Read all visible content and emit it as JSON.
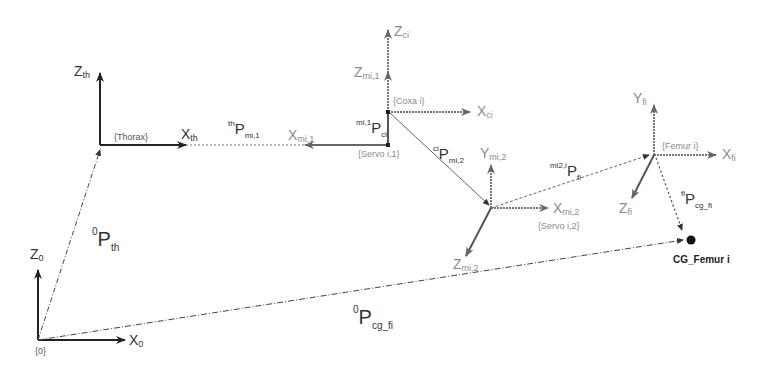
{
  "diagram": {
    "type": "kinematic-frame-diagram",
    "frames": [
      {
        "id": "world",
        "label": "{0}",
        "axes": {
          "z": {
            "base": "Z",
            "sub": "0"
          },
          "x": {
            "base": "X",
            "sub": "0"
          }
        }
      },
      {
        "id": "thorax",
        "label": "{Thorax}",
        "axes": {
          "z": {
            "base": "Z",
            "sub": "th"
          },
          "x": {
            "base": "X",
            "sub": "th"
          }
        }
      },
      {
        "id": "servo1",
        "label": "{Servo i,1}",
        "axes": {
          "z": {
            "base": "Z",
            "sub": "mi,1"
          },
          "x": {
            "base": "X",
            "sub": "mi,1"
          }
        }
      },
      {
        "id": "coxa",
        "label": "{Coxa i}",
        "axes": {
          "z": {
            "base": "Z",
            "sub": "ci"
          },
          "x": {
            "base": "X",
            "sub": "ci"
          }
        }
      },
      {
        "id": "servo2",
        "label": "{Servo i,2}",
        "axes": {
          "y": {
            "base": "Y",
            "sub": "mi,2"
          },
          "x": {
            "base": "X",
            "sub": "mi,2"
          },
          "z": {
            "base": "Z",
            "sub": "mi,2"
          }
        }
      },
      {
        "id": "femur",
        "label": "{Femur i}",
        "axes": {
          "y": {
            "base": "Y",
            "sub": "fi"
          },
          "x": {
            "base": "X",
            "sub": "fi"
          },
          "z": {
            "base": "Z",
            "sub": "fi"
          }
        }
      }
    ],
    "vectors": [
      {
        "id": "p0_th",
        "pre": "0",
        "base": "P",
        "sub": "th"
      },
      {
        "id": "pth_mi1",
        "pre": "th",
        "base": "P",
        "sub": "mi,1"
      },
      {
        "id": "pmi1_ci",
        "pre": "mi,1",
        "base": "P",
        "sub": "ci"
      },
      {
        "id": "pci_mi2",
        "pre": "ci",
        "base": "P",
        "sub": "mi,2"
      },
      {
        "id": "pmi2_fi",
        "pre": "mi2,i",
        "base": "P",
        "sub": "fi"
      },
      {
        "id": "pfi_cg",
        "pre": "fi",
        "base": "P",
        "sub": "cg_fi"
      },
      {
        "id": "p0_cg",
        "pre": "0",
        "base": "P",
        "sub": "cg_fi"
      }
    ],
    "points": [
      {
        "id": "cg_femur",
        "label": "CG_Femur i"
      }
    ]
  }
}
